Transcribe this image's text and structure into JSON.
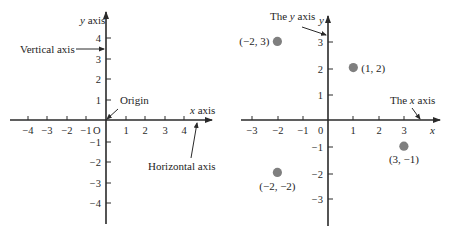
{
  "left_figure": {
    "y_axis_label": "y axis",
    "x_axis_label": "x axis",
    "vertical_axis_label": "Vertical axis",
    "horizontal_axis_label": "Horizontal axis",
    "origin_label": "Origin",
    "origin_tick": "O",
    "x_ticks": [
      {
        "label": "−4",
        "x": 28
      },
      {
        "label": "−3",
        "x": 47
      },
      {
        "label": "−2",
        "x": 67
      },
      {
        "label": "−1",
        "x": 86
      },
      {
        "label": "1",
        "x": 126
      },
      {
        "label": "2",
        "x": 145
      },
      {
        "label": "3",
        "x": 165
      },
      {
        "label": "4",
        "x": 184
      }
    ],
    "y_ticks": [
      {
        "label": "4",
        "y": 38
      },
      {
        "label": "3",
        "y": 59
      },
      {
        "label": "2",
        "y": 79
      },
      {
        "label": "1",
        "y": 100
      },
      {
        "label": "−1",
        "y": 142
      },
      {
        "label": "−2",
        "y": 162
      },
      {
        "label": "−3",
        "y": 183
      },
      {
        "label": "−4",
        "y": 203
      }
    ]
  },
  "right_figure": {
    "y_axis_label": "y",
    "x_axis_label": "x",
    "y_axis_callout": "The y axis",
    "x_axis_callout": "The x axis",
    "origin_tick": "0",
    "x_ticks": [
      {
        "label": "−3",
        "x": 252
      },
      {
        "label": "−2",
        "x": 278
      },
      {
        "label": "−1",
        "x": 303
      },
      {
        "label": "1",
        "x": 353
      },
      {
        "label": "2",
        "x": 379
      },
      {
        "label": "3",
        "x": 404
      }
    ],
    "y_ticks": [
      {
        "label": "3",
        "y": 42
      },
      {
        "label": "2",
        "y": 69
      },
      {
        "label": "1",
        "y": 95
      },
      {
        "label": "−1",
        "y": 147
      },
      {
        "label": "−2",
        "y": 174
      },
      {
        "label": "−3",
        "y": 199
      }
    ],
    "points": [
      {
        "label": "(−2, 3)",
        "x": -2,
        "y": 3
      },
      {
        "label": "(1, 2)",
        "x": 1,
        "y": 2
      },
      {
        "label": "(3, −1)",
        "x": 3,
        "y": -1
      },
      {
        "label": "(−2, −2)",
        "x": -2,
        "y": -2
      }
    ],
    "point_color": "#7f7f7f"
  }
}
